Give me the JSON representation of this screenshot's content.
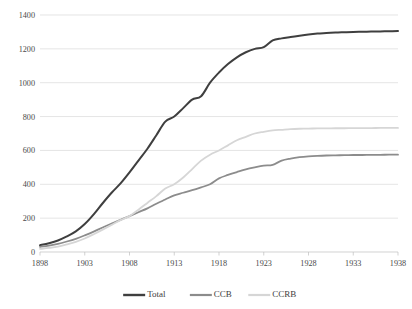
{
  "chart_data": {
    "type": "line",
    "title": "",
    "subtitle": "",
    "xlabel": "",
    "ylabel": "",
    "x": [
      1898,
      1899,
      1900,
      1901,
      1902,
      1903,
      1904,
      1905,
      1906,
      1907,
      1908,
      1909,
      1910,
      1911,
      1912,
      1913,
      1914,
      1915,
      1916,
      1917,
      1918,
      1919,
      1920,
      1921,
      1922,
      1923,
      1924,
      1925,
      1926,
      1927,
      1928,
      1929,
      1930,
      1931,
      1932,
      1933,
      1934,
      1935,
      1936,
      1937,
      1938
    ],
    "xtick_labels": [
      "1898",
      "1903",
      "1908",
      "1913",
      "1918",
      "1923",
      "1928",
      "1933",
      "1938"
    ],
    "xtick_values": [
      1898,
      1903,
      1908,
      1913,
      1918,
      1923,
      1928,
      1933,
      1938
    ],
    "ytick_labels": [
      "0",
      "200",
      "400",
      "600",
      "800",
      "1000",
      "1200",
      "1400"
    ],
    "ytick_values": [
      0,
      200,
      400,
      600,
      800,
      1000,
      1200,
      1400
    ],
    "xlim": [
      1898,
      1938
    ],
    "ylim": [
      0,
      1400
    ],
    "grid": true,
    "legend_position": "bottom",
    "series": [
      {
        "name": "Total",
        "color": "#3f3f3f",
        "width": 2.0,
        "values": [
          40,
          52,
          68,
          92,
          122,
          165,
          222,
          288,
          350,
          405,
          470,
          540,
          610,
          690,
          770,
          800,
          850,
          900,
          920,
          1000,
          1060,
          1110,
          1150,
          1180,
          1200,
          1210,
          1250,
          1262,
          1270,
          1278,
          1285,
          1290,
          1293,
          1296,
          1298,
          1300,
          1301,
          1302,
          1303,
          1304,
          1305
        ]
      },
      {
        "name": "CCB",
        "color": "#8c8c8c",
        "width": 1.8,
        "values": [
          30,
          38,
          48,
          62,
          78,
          98,
          120,
          145,
          168,
          190,
          212,
          235,
          258,
          285,
          310,
          335,
          350,
          365,
          382,
          400,
          435,
          455,
          472,
          488,
          500,
          510,
          515,
          540,
          552,
          560,
          565,
          568,
          570,
          571,
          572,
          573,
          573,
          574,
          574,
          575,
          575
        ]
      },
      {
        "name": "CCRB",
        "color": "#d6d6d6",
        "width": 1.8,
        "values": [
          18,
          24,
          32,
          45,
          60,
          80,
          105,
          132,
          160,
          188,
          212,
          250,
          290,
          330,
          375,
          400,
          440,
          490,
          540,
          575,
          600,
          630,
          660,
          680,
          700,
          710,
          718,
          722,
          726,
          728,
          729,
          730,
          730,
          731,
          731,
          732,
          732,
          732,
          733,
          733,
          733
        ]
      }
    ]
  },
  "legend": {
    "items": [
      {
        "label": "Total"
      },
      {
        "label": "CCB"
      },
      {
        "label": "CCRB"
      }
    ]
  }
}
